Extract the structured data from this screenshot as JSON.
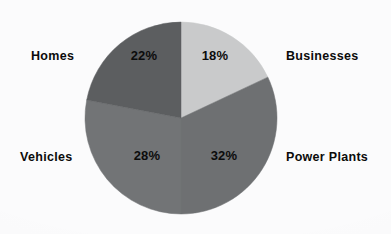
{
  "chart_data": {
    "type": "pie",
    "title": "",
    "labels": [
      "Businesses",
      "Power Plants",
      "Vehicles",
      "Homes"
    ],
    "values": [
      18,
      32,
      28,
      22
    ],
    "value_labels": [
      "18%",
      "32%",
      "28%",
      "22%"
    ],
    "unit": "%",
    "total": 100,
    "start_angle_deg": 0,
    "direction": "clockwise",
    "legend": "none",
    "grid": false,
    "slice_colors": [
      "#c9cacb",
      "#6e7072",
      "#727476",
      "#5c5e60"
    ],
    "slices": [
      {
        "label": "Businesses",
        "value": 18,
        "value_label": "18%",
        "color": "#c9cacb",
        "label_side": "right"
      },
      {
        "label": "Power Plants",
        "value": 32,
        "value_label": "32%",
        "color": "#6e7072",
        "label_side": "right"
      },
      {
        "label": "Vehicles",
        "value": 28,
        "value_label": "28%",
        "color": "#727476",
        "label_side": "left"
      },
      {
        "label": "Homes",
        "value": 22,
        "value_label": "22%",
        "color": "#5c5e60",
        "label_side": "left"
      }
    ]
  },
  "figure": {
    "background_color": "#fbfbfc",
    "text_color": "#0b0b0b",
    "center_x": 97,
    "center_y": 97,
    "radius": 96
  }
}
